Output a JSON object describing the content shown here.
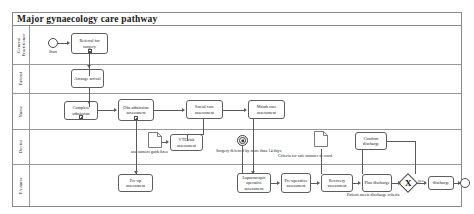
{
  "diagram": {
    "title": "Major gynaecology care pathway",
    "type": "bpmn-pool-swimlane"
  },
  "lanes": [
    {
      "id": "gp",
      "label": "General\nPractitioner"
    },
    {
      "id": "patient",
      "label": "Patient"
    },
    {
      "id": "nurse",
      "label": "Nurse"
    },
    {
      "id": "doctor",
      "label": "Doctor"
    },
    {
      "id": "panurse",
      "label": "PA nurse"
    }
  ],
  "events": {
    "start": {
      "label": "Start"
    },
    "timer": {
      "label": ""
    },
    "end": {
      "label": ""
    }
  },
  "tasks": {
    "referral_for_surgery": "Referral for surgery",
    "arrange_arrival": "Arrange arrival",
    "complete_admission": "Complete admission",
    "obs_admission_assessment": "Obs admission assessment",
    "social_care_assessment": "Social care assessment",
    "mouth_care_assessment": "Mouth care assessment",
    "vte_risk_assessment": "VTE risk assessment",
    "confirm_discharge": "Confirm discharge",
    "pre_op_assessment": "Pre-op assessment",
    "laparoscopic_operative_assessment": "Laparoscopic operative assessment",
    "pre_operative_assessment": "Pre-operative assessment",
    "recovery_assessment": "Recovery assessment",
    "plan_discharge": "Plan discharge",
    "discharge": "discharge"
  },
  "gateway": {
    "symbol": "X",
    "annotation": "Patient meets discharge criteria",
    "yes_label": "yes"
  },
  "documents": {
    "assessment_guidelines": "assessment guidelines",
    "criteria_for_safe_transfer": "Criteria for safe transfer to ward"
  },
  "annotations": {
    "surgery_deferred": "Surgery deferred by more than 14 days"
  }
}
